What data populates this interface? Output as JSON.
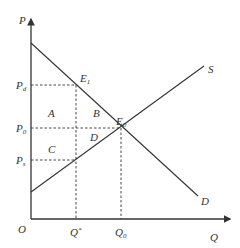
{
  "diagram": {
    "type": "supply-demand-tax-wedge",
    "colors": {
      "line": "#333333",
      "background": "#ffffff"
    },
    "axes": {
      "origin_label": "O",
      "y_label": "P",
      "x_label": "Q"
    },
    "curves": {
      "supply_label": "S",
      "demand_label": "D"
    },
    "points": {
      "e1_main": "E",
      "e1_sub": "1",
      "e0_main": "E",
      "e0_sub": "0"
    },
    "price_ticks": {
      "pd_main": "P",
      "pd_sub": "d",
      "p0_main": "P",
      "p0_sub": "0",
      "ps_main": "P",
      "ps_sub": "s"
    },
    "quantity_ticks": {
      "qstar_main": "Q",
      "qstar_sup": "*",
      "q0_main": "Q",
      "q0_sub": "0"
    },
    "regions": {
      "a": "A",
      "b": "B",
      "c": "C",
      "d": "D"
    }
  }
}
